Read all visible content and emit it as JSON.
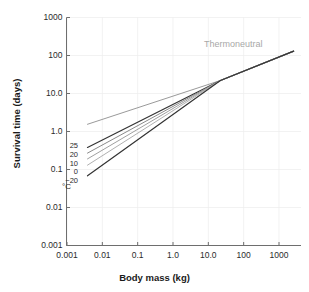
{
  "chart_data": {
    "type": "line",
    "title": "",
    "xlabel": "Body mass (kg)",
    "ylabel": "Survival time (days)",
    "xscale": "log",
    "yscale": "log",
    "xlim": [
      0.001,
      1000
    ],
    "ylim": [
      0.001,
      1000
    ],
    "xticks": [
      "0.001",
      "0.01",
      "0.1",
      "1.0",
      "10.0",
      "100",
      "1000"
    ],
    "xtick_values": [
      0.001,
      0.01,
      0.1,
      1.0,
      10.0,
      100,
      1000
    ],
    "yticks": [
      "0.001",
      "0.01",
      "0.1",
      "1.0",
      "10.0",
      "100",
      "1000"
    ],
    "ytick_values": [
      0.001,
      0.01,
      0.1,
      1.0,
      10.0,
      100,
      1000
    ],
    "grid": true,
    "legend_position": "inline-left",
    "annotations": [
      {
        "name": "thermoneutral",
        "text": "Thermoneutral",
        "x": 100,
        "y": 230,
        "color": "#a8a8a8"
      },
      {
        "name": "unit",
        "text": "°C",
        "x": 0.005,
        "y": 0.045
      }
    ],
    "convergence_point": {
      "x": 22,
      "y": 22
    },
    "series": [
      {
        "name": "Thermoneutral",
        "label": "Thermoneutral",
        "color": "#9a9a9a",
        "width": 1.0,
        "points": [
          [
            0.0038,
            1.55
          ],
          [
            22,
            22
          ],
          [
            2600,
            130
          ]
        ]
      },
      {
        "name": "25",
        "label": "25",
        "color": "#333333",
        "width": 1.2,
        "points": [
          [
            0.0038,
            0.38
          ],
          [
            22,
            22
          ],
          [
            2600,
            130
          ]
        ]
      },
      {
        "name": "20",
        "label": "20",
        "color": "#8a8a8a",
        "width": 1.0,
        "points": [
          [
            0.0038,
            0.27
          ],
          [
            22,
            22
          ],
          [
            2600,
            130
          ]
        ]
      },
      {
        "name": "10",
        "label": "10",
        "color": "#a0a0a0",
        "width": 1.0,
        "points": [
          [
            0.0038,
            0.19
          ],
          [
            22,
            22
          ],
          [
            2600,
            130
          ]
        ]
      },
      {
        "name": "0",
        "label": "0",
        "color": "#b0b0b0",
        "width": 1.0,
        "points": [
          [
            0.0038,
            0.13
          ],
          [
            22,
            22
          ],
          [
            2600,
            130
          ]
        ]
      },
      {
        "name": "-20",
        "label": "−20",
        "color": "#333333",
        "width": 1.2,
        "points": [
          [
            0.0038,
            0.068
          ],
          [
            22,
            22
          ],
          [
            2600,
            130
          ]
        ]
      }
    ],
    "series_labels": [
      {
        "label": "25",
        "y_px": 146
      },
      {
        "label": "20",
        "y_px": 155
      },
      {
        "label": "10",
        "y_px": 164
      },
      {
        "label": "0",
        "y_px": 172
      },
      {
        "label": "−20",
        "y_px": 181
      }
    ],
    "unit_label": "°C",
    "axis_color": "#6e6e6e",
    "grid_color": "#ededed",
    "text_color": "#2b2b2b",
    "background": "#ffffff"
  }
}
